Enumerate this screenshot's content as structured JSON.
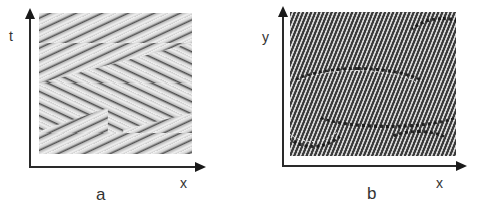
{
  "figure": {
    "panels": [
      {
        "id": "a",
        "caption": "a",
        "x_axis_label": "x",
        "y_axis_label": "t",
        "description": "space-time plot showing chevron / herringbone pattern of traveling waves"
      },
      {
        "id": "b",
        "caption": "b",
        "x_axis_label": "x",
        "y_axis_label": "y",
        "description": "two-dimensional oblique roll pattern with domain walls"
      }
    ],
    "colors": {
      "axis": "#2a2a2a",
      "text": "#333333",
      "pattern_a_bg": "#e6e6e6",
      "pattern_b_dark": "#3a3a3a",
      "pattern_b_light": "#d8d8d8"
    }
  }
}
